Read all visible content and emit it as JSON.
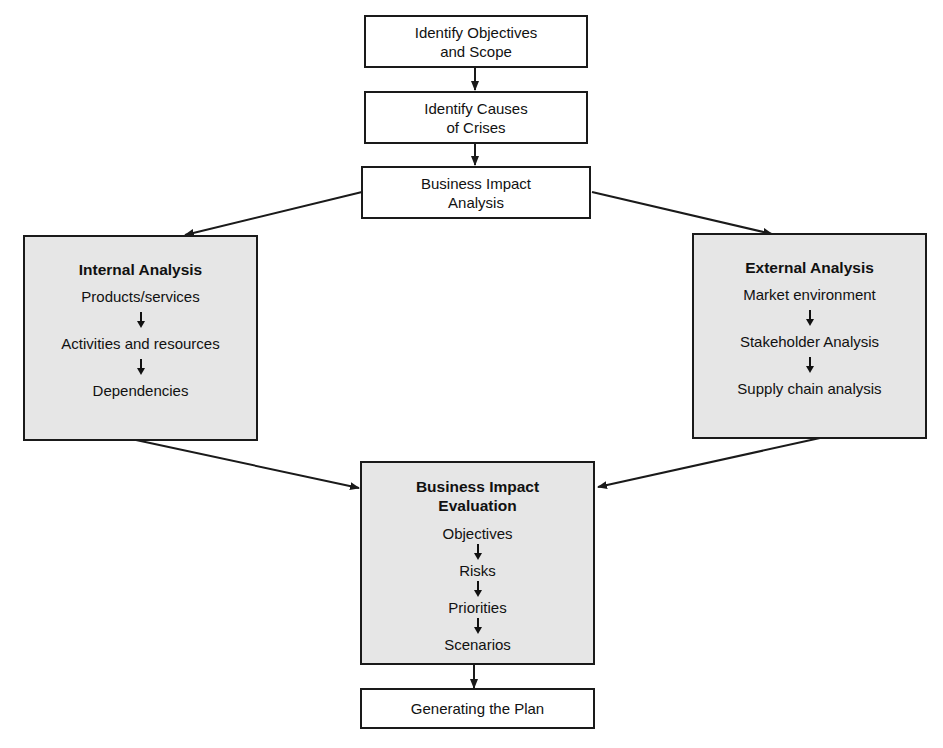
{
  "diagram": {
    "nodes": {
      "objectives_scope": {
        "lines": [
          "Identify Objectives",
          "and Scope"
        ]
      },
      "causes_crises": {
        "lines": [
          "Identify Causes",
          "of Crises"
        ]
      },
      "bia": {
        "lines": [
          "Business Impact",
          "Analysis"
        ]
      },
      "internal": {
        "title": "Internal Analysis",
        "items": [
          "Products/services",
          "Activities and resources",
          "Dependencies"
        ]
      },
      "external": {
        "title": "External Analysis",
        "items": [
          "Market environment",
          "Stakeholder Analysis",
          "Supply chain analysis"
        ]
      },
      "evaluation": {
        "title_lines": [
          "Business Impact",
          "Evaluation"
        ],
        "items": [
          "Objectives",
          "Risks",
          "Priorities",
          "Scenarios"
        ]
      },
      "plan": {
        "lines": [
          "Generating the Plan"
        ]
      }
    },
    "edges": [
      [
        "objectives_scope",
        "causes_crises"
      ],
      [
        "causes_crises",
        "bia"
      ],
      [
        "bia",
        "internal"
      ],
      [
        "bia",
        "external"
      ],
      [
        "internal",
        "evaluation"
      ],
      [
        "external",
        "evaluation"
      ],
      [
        "evaluation",
        "plan"
      ]
    ],
    "colors": {
      "line": "#1a1a1a",
      "shaded_fill": "#e6e6e6",
      "plain_fill": "#ffffff"
    }
  }
}
